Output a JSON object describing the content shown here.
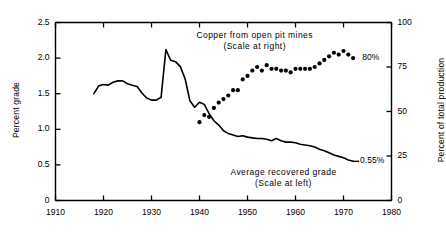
{
  "chart_data": {
    "type": "line",
    "title": "",
    "xlabel": "",
    "ylabel": "Percent grade",
    "ylabel_right": "Percent of total production",
    "xlim": [
      1910,
      1980
    ],
    "ylim": [
      0,
      2.5
    ],
    "ylim_right": [
      0,
      100
    ],
    "grid": false,
    "legend_position": "inline-annotations",
    "xticks": [
      1910,
      1920,
      1930,
      1940,
      1950,
      1960,
      1970,
      1980
    ],
    "xtick_labels": [
      "1910",
      "1920",
      "1930",
      "1940",
      "1950",
      "1960",
      "1970",
      "1980"
    ],
    "yticks_left": [
      0,
      0.5,
      1.0,
      1.5,
      2.0,
      2.5
    ],
    "ytick_labels_left": [
      "0",
      "0.5",
      "1.0",
      "1.5",
      "2.0",
      "2.5"
    ],
    "yticks_right": [
      0,
      25,
      50,
      75,
      100
    ],
    "ytick_labels_right": [
      "0",
      "25",
      "50",
      "75",
      "100"
    ],
    "annotations": [
      {
        "name": "open-pit-annotation",
        "line1": "Copper from open pit mines",
        "line2": "(Scale at right)",
        "x": 1951.5,
        "y_px": 30
      },
      {
        "name": "average-grade-annotation",
        "line1": "Average recovered grade",
        "line2": "(Scale at left)",
        "x": 1957.5,
        "y_px": 167
      },
      {
        "name": "open-pit-end-value",
        "text": "80%",
        "x": 1973.5,
        "value": 80
      },
      {
        "name": "average-grade-end-value",
        "text": "0.55%",
        "x": 1973.0,
        "value": 0.55
      }
    ],
    "series": [
      {
        "name": "Average recovered grade",
        "axis": "left",
        "style": "solid-line",
        "units": "percent grade",
        "x": [
          1918,
          1919,
          1920,
          1921,
          1922,
          1923,
          1924,
          1925,
          1926,
          1927,
          1928,
          1929,
          1930,
          1931,
          1932,
          1933,
          1934,
          1935,
          1936,
          1937,
          1938,
          1939,
          1940,
          1941,
          1942,
          1943,
          1944,
          1945,
          1946,
          1947,
          1948,
          1949,
          1950,
          1951,
          1952,
          1953,
          1954,
          1955,
          1956,
          1957,
          1958,
          1959,
          1960,
          1961,
          1962,
          1963,
          1964,
          1965,
          1966,
          1967,
          1968,
          1969,
          1970,
          1971,
          1972
        ],
        "values": [
          1.5,
          1.61,
          1.63,
          1.62,
          1.66,
          1.68,
          1.68,
          1.64,
          1.62,
          1.6,
          1.51,
          1.44,
          1.41,
          1.41,
          1.45,
          2.12,
          1.97,
          1.95,
          1.88,
          1.71,
          1.4,
          1.31,
          1.38,
          1.35,
          1.22,
          1.12,
          1.06,
          0.98,
          0.94,
          0.92,
          0.9,
          0.91,
          0.89,
          0.88,
          0.87,
          0.87,
          0.86,
          0.84,
          0.87,
          0.84,
          0.82,
          0.82,
          0.81,
          0.79,
          0.78,
          0.77,
          0.75,
          0.72,
          0.7,
          0.67,
          0.64,
          0.62,
          0.6,
          0.57,
          0.55
        ]
      },
      {
        "name": "Copper from open pit mines",
        "axis": "right",
        "style": "dots",
        "units": "percent of total production",
        "x": [
          1940,
          1941,
          1942,
          1943,
          1944,
          1945,
          1946,
          1947,
          1948,
          1949,
          1950,
          1951,
          1952,
          1953,
          1954,
          1955,
          1956,
          1957,
          1958,
          1959,
          1960,
          1961,
          1962,
          1963,
          1964,
          1965,
          1966,
          1967,
          1968,
          1969,
          1970,
          1971,
          1972
        ],
        "values": [
          44,
          48,
          47,
          52,
          55,
          57,
          59,
          62,
          62,
          68,
          70,
          73,
          75,
          73,
          76,
          74,
          74,
          73,
          73,
          72,
          74,
          74,
          74,
          74,
          75,
          77,
          79,
          81,
          83,
          82,
          84,
          82,
          80
        ]
      }
    ]
  }
}
